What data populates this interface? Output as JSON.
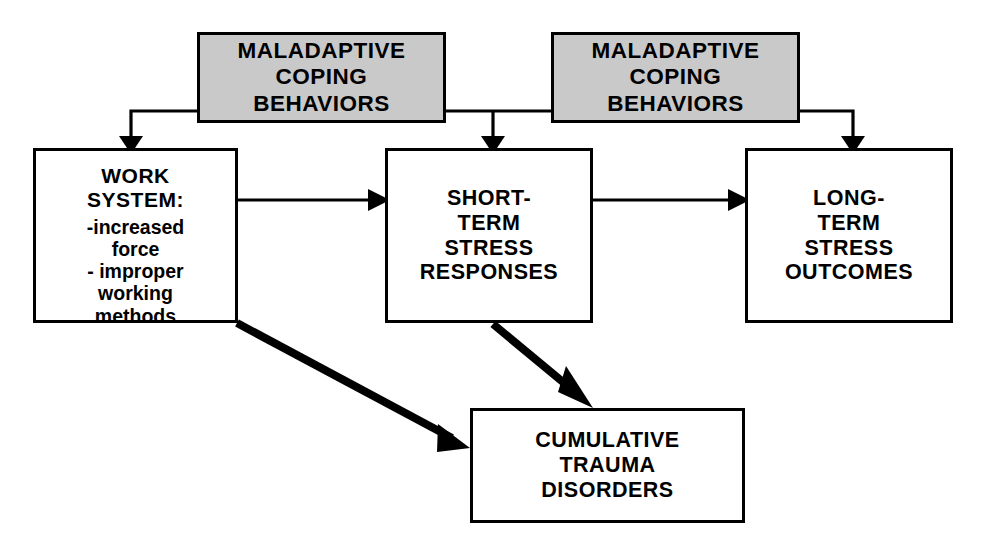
{
  "diagram": {
    "colors": {
      "shaded_fill": "#c9c9c9",
      "stroke": "#000000",
      "background": "#ffffff",
      "node_fill": "#ffffff"
    },
    "nodes": {
      "maladaptive_left": {
        "lines": [
          "MALADAPTIVE",
          "COPING",
          "BEHAVIORS"
        ],
        "style": "shaded"
      },
      "maladaptive_right": {
        "lines": [
          "MALADAPTIVE",
          "COPING",
          "BEHAVIORS"
        ],
        "style": "shaded"
      },
      "work_system": {
        "heading": [
          "WORK",
          "SYSTEM:"
        ],
        "items": [
          "-increased",
          "force",
          "- improper",
          "working",
          "methods"
        ],
        "style": "plain"
      },
      "short_term": {
        "lines": [
          "SHORT-",
          "TERM",
          "STRESS",
          "RESPONSES"
        ],
        "style": "plain"
      },
      "long_term": {
        "lines": [
          "LONG-",
          "TERM",
          "STRESS",
          "OUTCOMES"
        ],
        "style": "plain"
      },
      "cumulative": {
        "lines": [
          "CUMULATIVE",
          "TRAUMA",
          "DISORDERS"
        ],
        "style": "plain"
      }
    },
    "edges": [
      {
        "name": "maladaptive-left-to-work-system",
        "from": "maladaptive_left",
        "to": "work_system",
        "weight": "thin",
        "arrow": "down"
      },
      {
        "name": "maladaptive-left-to-short-term",
        "from": "maladaptive_left",
        "to": "short_term",
        "weight": "thin",
        "arrow": "down"
      },
      {
        "name": "maladaptive-right-to-short-term",
        "from": "maladaptive_right",
        "to": "short_term",
        "weight": "thin",
        "arrow": "down"
      },
      {
        "name": "maladaptive-right-to-long-term",
        "from": "maladaptive_right",
        "to": "long_term",
        "weight": "thin",
        "arrow": "down"
      },
      {
        "name": "work-system-to-short-term",
        "from": "work_system",
        "to": "short_term",
        "weight": "thin",
        "arrow": "right"
      },
      {
        "name": "short-term-to-long-term",
        "from": "short_term",
        "to": "long_term",
        "weight": "thin",
        "arrow": "right"
      },
      {
        "name": "work-system-to-cumulative",
        "from": "work_system",
        "to": "cumulative",
        "weight": "thick",
        "arrow": "diagonal-down-right"
      },
      {
        "name": "short-term-to-cumulative",
        "from": "short_term",
        "to": "cumulative",
        "weight": "thick",
        "arrow": "diagonal-down-right"
      }
    ]
  }
}
